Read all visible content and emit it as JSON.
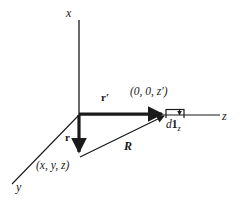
{
  "figure": {
    "width": 242,
    "height": 203,
    "background_color": "#ffffff",
    "line_color": "#1a1a1a",
    "origin": {
      "x": 79,
      "y": 115
    }
  },
  "axes": [
    {
      "name": "x-axis",
      "label": "x",
      "from": {
        "x": 79,
        "y": 115
      },
      "to": {
        "x": 79,
        "y": 20
      },
      "label_pos": {
        "x": 68,
        "y": 8
      }
    },
    {
      "name": "y-axis",
      "label": "y",
      "from": {
        "x": 79,
        "y": 115
      },
      "to": {
        "x": 12,
        "y": 184
      },
      "label_pos": {
        "x": 16,
        "y": 184
      }
    },
    {
      "name": "z-axis",
      "label": "z",
      "from": {
        "x": 79,
        "y": 115
      },
      "to": {
        "x": 220,
        "y": 115
      },
      "label_pos": {
        "x": 222,
        "y": 116
      }
    }
  ],
  "vectors": [
    {
      "name": "r-prime-vector",
      "label": "r′",
      "description": "Source position vector along z-axis",
      "from": {
        "x": 79,
        "y": 114
      },
      "to": {
        "x": 167,
        "y": 114
      },
      "label_pos": {
        "x": 101,
        "y": 94
      }
    },
    {
      "name": "r-vector",
      "label": "r",
      "description": "Field point position vector",
      "from": {
        "x": 79,
        "y": 115
      },
      "to": {
        "x": 79,
        "y": 158
      },
      "label_pos": {
        "x": 66,
        "y": 133
      }
    },
    {
      "name": "R-vector",
      "label": "R",
      "description": "Separation vector from field point to source point",
      "from": {
        "x": 80,
        "y": 157
      },
      "to": {
        "x": 168,
        "y": 114
      },
      "label_pos": {
        "x": 124,
        "y": 140
      }
    }
  ],
  "points": [
    {
      "name": "source-point",
      "label": "(0, 0, z′)",
      "at": {
        "x": 167,
        "y": 114
      },
      "label_pos": {
        "x": 130,
        "y": 86
      }
    },
    {
      "name": "field-point",
      "label": "(x, y, z)",
      "at": {
        "x": 79,
        "y": 158
      },
      "label_pos": {
        "x": 36,
        "y": 160
      }
    }
  ],
  "element": {
    "name": "differential-length-element",
    "label_d": "d",
    "label_vector": "1",
    "label_subscript": "z",
    "full_label": "d1₂",
    "bracket": {
      "left_x": 166,
      "right_x": 184,
      "top_y": 109,
      "tick_bottom_y": 117,
      "arrow_x": 180,
      "arrow_tip_y": 118
    },
    "label_pos": {
      "x": 166,
      "y": 120
    }
  }
}
